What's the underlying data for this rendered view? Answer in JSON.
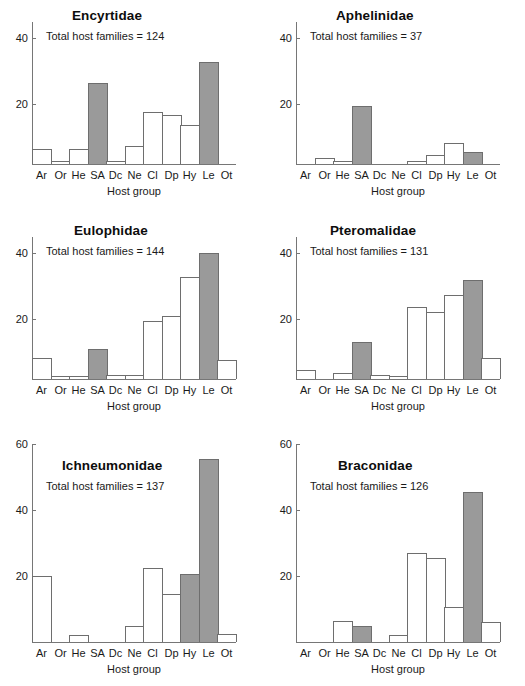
{
  "figure": {
    "axis_title": "Host group",
    "categories": [
      "Ar",
      "Or",
      "He",
      "SA",
      "Dc",
      "Ne",
      "Cl",
      "Dp",
      "Hy",
      "Le",
      "Ot"
    ],
    "highlight_categories": [
      "SA",
      "Le"
    ],
    "colors": {
      "bar_open": "#ffffff",
      "bar_filled": "#9a9a9a",
      "bar_outline": "#6e6e6e",
      "axis": "#767676",
      "text": "#1a1a1a"
    }
  },
  "chart_data": [
    {
      "type": "bar",
      "title": "Encyrtidae",
      "annotation": "Total host families = 124",
      "xlabel": "Host group",
      "ylabel": "",
      "ylim": [
        0,
        46
      ],
      "yticks": [
        20,
        40
      ],
      "ytick_labels": [
        "20",
        "40"
      ],
      "grid": false,
      "categories": [
        "Ar",
        "Or",
        "He",
        "SA",
        "Dc",
        "Ne",
        "Cl",
        "Dp",
        "Hy",
        "Le",
        "Ot"
      ],
      "values": [
        5,
        1,
        5,
        27,
        1,
        6,
        17.5,
        16.5,
        13,
        34,
        0
      ],
      "filled": [
        false,
        false,
        false,
        true,
        false,
        false,
        false,
        false,
        false,
        true,
        false
      ]
    },
    {
      "type": "bar",
      "title": "Aphelinidae",
      "annotation": "Total host families = 37",
      "xlabel": "Host group",
      "ylabel": "",
      "ylim": [
        0,
        46
      ],
      "yticks": [
        20,
        40
      ],
      "ytick_labels": [
        "20",
        "40"
      ],
      "grid": false,
      "categories": [
        "Ar",
        "Or",
        "He",
        "SA",
        "Dc",
        "Ne",
        "Cl",
        "Dp",
        "Hy",
        "Le",
        "Ot"
      ],
      "values": [
        0,
        2,
        1,
        19.5,
        0,
        0,
        1,
        3,
        7,
        4,
        0
      ],
      "filled": [
        false,
        false,
        false,
        true,
        false,
        false,
        false,
        false,
        false,
        true,
        false
      ]
    },
    {
      "type": "bar",
      "title": "Eulophidae",
      "annotation": "Total host families = 144",
      "xlabel": "Host group",
      "ylabel": "",
      "ylim": [
        0,
        46
      ],
      "yticks": [
        20,
        40
      ],
      "ytick_labels": [
        "20",
        "40"
      ],
      "grid": false,
      "categories": [
        "Ar",
        "Or",
        "He",
        "SA",
        "Dc",
        "Ne",
        "Cl",
        "Dp",
        "Hy",
        "Le",
        "Ot"
      ],
      "values": [
        7,
        1,
        1,
        10,
        1.5,
        1.5,
        19.5,
        21,
        34,
        42,
        6.5
      ],
      "filled": [
        false,
        false,
        false,
        true,
        false,
        false,
        false,
        false,
        false,
        true,
        false
      ]
    },
    {
      "type": "bar",
      "title": "Pteromalidae",
      "annotation": "Total host families = 131",
      "xlabel": "Host group",
      "ylabel": "",
      "ylim": [
        0,
        46
      ],
      "yticks": [
        20,
        40
      ],
      "ytick_labels": [
        "20",
        "40"
      ],
      "grid": false,
      "categories": [
        "Ar",
        "Or",
        "He",
        "SA",
        "Dc",
        "Ne",
        "Cl",
        "Dp",
        "Hy",
        "Le",
        "Ot"
      ],
      "values": [
        3,
        0,
        2,
        12.5,
        1.5,
        1,
        24,
        22.5,
        28,
        33,
        7
      ],
      "filled": [
        false,
        false,
        false,
        true,
        false,
        false,
        false,
        false,
        false,
        true,
        false
      ]
    },
    {
      "type": "bar",
      "title": "Ichneumonidae",
      "annotation": "Total host families = 137",
      "xlabel": "Host group",
      "ylabel": "",
      "ylim": [
        0,
        64
      ],
      "yticks": [
        20,
        40,
        60
      ],
      "ytick_labels": [
        "20",
        "40",
        "60"
      ],
      "grid": false,
      "categories": [
        "Ar",
        "Or",
        "He",
        "SA",
        "Dc",
        "Ne",
        "Cl",
        "Dp",
        "Hy",
        "Le",
        "Ot"
      ],
      "values": [
        20,
        0,
        2,
        0,
        0,
        5,
        22.5,
        14.5,
        20.5,
        55.5,
        2.5
      ],
      "filled": [
        false,
        false,
        false,
        true,
        false,
        false,
        false,
        false,
        true,
        true,
        false
      ]
    },
    {
      "type": "bar",
      "title": "Braconidae",
      "annotation": "Total host families = 126",
      "xlabel": "Host group",
      "ylabel": "",
      "ylim": [
        0,
        64
      ],
      "yticks": [
        20,
        40,
        60
      ],
      "ytick_labels": [
        "20",
        "40",
        "60"
      ],
      "grid": false,
      "categories": [
        "Ar",
        "Or",
        "He",
        "SA",
        "Dc",
        "Ne",
        "Cl",
        "Dp",
        "Hy",
        "Le",
        "Ot"
      ],
      "values": [
        0,
        0,
        6.5,
        5,
        0,
        2,
        27,
        25.5,
        10.5,
        45.5,
        6
      ],
      "filled": [
        false,
        false,
        false,
        true,
        false,
        false,
        false,
        false,
        false,
        true,
        false
      ]
    }
  ]
}
